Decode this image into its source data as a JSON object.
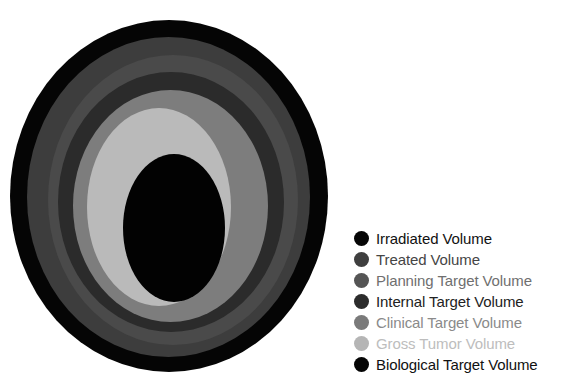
{
  "diagram": {
    "title": "",
    "layers": [
      {
        "name": "Irradiated Volume",
        "fill": "#050505",
        "cx": 169,
        "cy": 196,
        "rx": 159,
        "ry": 176
      },
      {
        "name": "Treated Volume",
        "fill": "#3d3d3d",
        "cx": 168.5,
        "cy": 197,
        "rx": 141.5,
        "ry": 160
      },
      {
        "name": "Planning Target Volume",
        "fill": "#4a4a4a",
        "cx": 173,
        "cy": 200,
        "rx": 125,
        "ry": 145
      },
      {
        "name": "Internal Target Volume",
        "fill": "#2b2b2b",
        "cx": 171,
        "cy": 202,
        "rx": 113,
        "ry": 130
      },
      {
        "name": "Clinical Target Volume",
        "fill": "#7d7d7d",
        "cx": 170.5,
        "cy": 206,
        "rx": 97.5,
        "ry": 116
      },
      {
        "name": "Gross Tumor Volume",
        "fill": "#bababa",
        "cx": 159,
        "cy": 207,
        "rx": 72,
        "ry": 99
      },
      {
        "name": "Biological Target Volume",
        "fill": "#020202",
        "cx": 174,
        "cy": 228,
        "rx": 51,
        "ry": 74
      }
    ]
  },
  "legend": {
    "items": [
      {
        "label": "Irradiated Volume",
        "dot_color": "#060606",
        "text_color": "#111111"
      },
      {
        "label": "Treated Volume",
        "dot_color": "#3f3f3f",
        "text_color": "#454545"
      },
      {
        "label": "Planning Target Volume",
        "dot_color": "#555555",
        "text_color": "#6f6f6f"
      },
      {
        "label": "Internal Target Volume",
        "dot_color": "#2c2c2c",
        "text_color": "#222222"
      },
      {
        "label": "Clinical Target Volume",
        "dot_color": "#7a7a7a",
        "text_color": "#8a8a8a"
      },
      {
        "label": "Gross Tumor Volume",
        "dot_color": "#b5b5b5",
        "text_color": "#bdbdbd"
      },
      {
        "label": "Biological Target Volume",
        "dot_color": "#050505",
        "text_color": "#111111"
      }
    ]
  }
}
